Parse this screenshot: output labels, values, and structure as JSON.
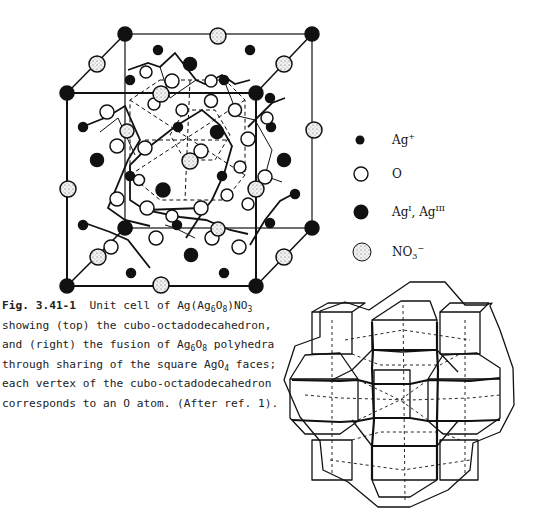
{
  "figure": {
    "number_label": "Fig. 3.41-1",
    "caption_lines": [
      "Unit cell of Ag(Ag6O8)NO3",
      "showing (top) the cubo-octadodecahedron,",
      "and (right) the fusion of Ag6O8 polyhedra",
      "through sharing of the square AgO4 faces;",
      "each vertex of the cubo-octadodecahedron",
      "corresponds to an O atom.  (After ref. 1)."
    ],
    "caption_parts": {
      "l1_a": "Unit cell of Ag(Ag",
      "l1_s1": "6",
      "l1_b": "O",
      "l1_s2": "8",
      "l1_c": ")NO",
      "l1_s3": "3",
      "l2": "showing (top) the cubo-octadodecahedron,",
      "l3_a": "and (right) the fusion of Ag",
      "l3_s1": "6",
      "l3_b": "O",
      "l3_s2": "8",
      "l3_c": " polyhedra",
      "l4_a": "through sharing of the square AgO",
      "l4_s1": "4",
      "l4_b": " faces;",
      "l5": "each vertex of the cubo-octadodecahedron",
      "l6": "corresponds to an O atom.  (After ref. 1)."
    }
  },
  "legend": {
    "items": [
      {
        "symbol": "small-filled-circle",
        "label_base": "Ag",
        "label_sup": "+"
      },
      {
        "symbol": "open-circle",
        "label_base": "O",
        "label_sup": ""
      },
      {
        "symbol": "large-filled-circle",
        "label_base": "Ag",
        "label_sup": "I",
        "label_mid": ", Ag",
        "label_sup2": "III"
      },
      {
        "symbol": "stippled-circle",
        "label_base": "NO",
        "label_sub": "3",
        "label_sup": "−"
      }
    ]
  },
  "panels": {
    "top": "unit-cell-diagram",
    "right": "fused-polyhedra-diagram"
  }
}
